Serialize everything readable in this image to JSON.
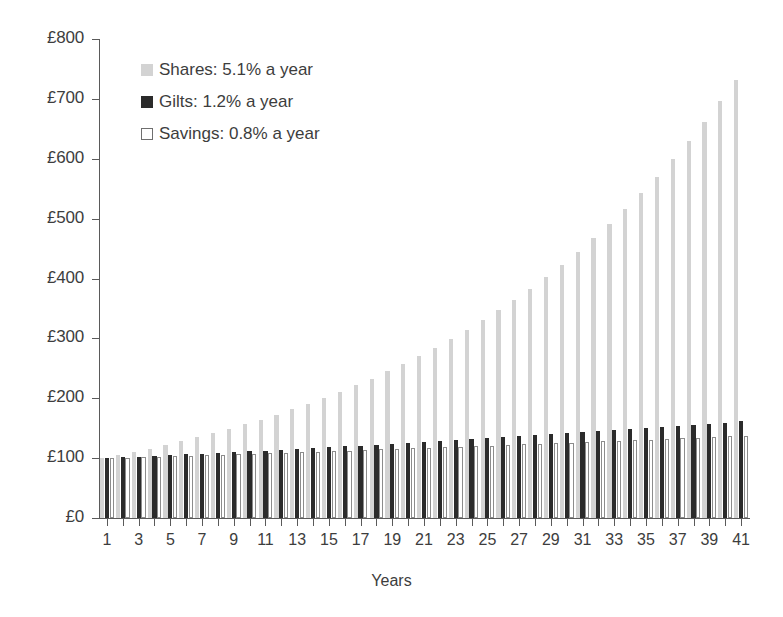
{
  "chart_data": {
    "type": "bar",
    "title": "",
    "subtitle": "",
    "xlabel": "Years",
    "ylabel": "",
    "grid": false,
    "legend_position": "top-left",
    "ylim": [
      0,
      800
    ],
    "ytick_values": [
      0,
      100,
      200,
      300,
      400,
      500,
      600,
      700,
      800
    ],
    "ytick_labels": [
      "£0",
      "£100",
      "£200",
      "£300",
      "£400",
      "£500",
      "£600",
      "£700",
      "£800"
    ],
    "categories": [
      1,
      2,
      3,
      4,
      5,
      6,
      7,
      8,
      9,
      10,
      11,
      12,
      13,
      14,
      15,
      16,
      17,
      18,
      19,
      20,
      21,
      22,
      23,
      24,
      25,
      26,
      27,
      28,
      29,
      30,
      31,
      32,
      33,
      34,
      35,
      36,
      37,
      38,
      39,
      40,
      41
    ],
    "xtick_labels": [
      "1",
      "3",
      "5",
      "7",
      "9",
      "11",
      "13",
      "15",
      "17",
      "19",
      "21",
      "23",
      "25",
      "27",
      "29",
      "31",
      "33",
      "35",
      "37",
      "39",
      "41"
    ],
    "series": [
      {
        "name": "Shares: 5.1% a year",
        "key": "shares",
        "color": "#d3d3d3",
        "rate_percent": 5.1,
        "values": [
          100.0,
          105.1,
          110.5,
          116.1,
          122.0,
          128.2,
          134.8,
          141.6,
          148.9,
          156.4,
          164.4,
          172.8,
          181.6,
          190.9,
          200.6,
          210.8,
          221.6,
          232.9,
          244.8,
          257.3,
          270.4,
          284.2,
          298.7,
          313.9,
          329.9,
          346.7,
          364.4,
          383.0,
          402.6,
          423.1,
          444.7,
          467.4,
          491.2,
          516.3,
          542.6,
          570.3,
          599.4,
          630.0,
          662.1,
          695.9,
          731.4
        ]
      },
      {
        "name": "Gilts: 1.2% a year",
        "key": "gilts",
        "color": "#2b2b2b",
        "rate_percent": 1.2,
        "values": [
          100.0,
          101.2,
          102.4,
          103.6,
          104.9,
          106.2,
          107.4,
          108.7,
          110.0,
          111.4,
          112.7,
          114.1,
          115.4,
          116.8,
          118.2,
          119.7,
          121.1,
          122.6,
          124.0,
          125.5,
          127.0,
          128.6,
          130.1,
          131.7,
          133.3,
          134.9,
          136.5,
          138.1,
          139.8,
          141.5,
          143.2,
          144.9,
          146.7,
          148.4,
          150.2,
          152.0,
          153.9,
          155.7,
          157.6,
          159.5,
          161.4
        ]
      },
      {
        "name": "Savings: 0.8% a year",
        "key": "savings",
        "color": "#ffffff",
        "rate_percent": 0.8,
        "values": [
          100.0,
          100.8,
          101.6,
          102.4,
          103.2,
          104.1,
          104.9,
          105.7,
          106.6,
          107.4,
          108.3,
          109.2,
          110.0,
          110.9,
          111.8,
          112.7,
          113.6,
          114.5,
          115.4,
          116.3,
          117.3,
          118.2,
          119.1,
          120.1,
          121.1,
          122.0,
          123.0,
          124.0,
          125.0,
          126.0,
          127.0,
          128.0,
          129.0,
          130.0,
          131.1,
          132.1,
          133.2,
          134.2,
          135.3,
          136.4,
          137.5
        ]
      }
    ]
  },
  "legend": {
    "items": [
      {
        "label": "Shares: 5.1% a year",
        "swatch": "shares-swatch"
      },
      {
        "label": "Gilts: 1.2% a year",
        "swatch": "gilts-swatch"
      },
      {
        "label": "Savings: 0.8% a year",
        "swatch": "savings-swatch"
      }
    ]
  },
  "axes": {
    "x_title": "Years"
  }
}
